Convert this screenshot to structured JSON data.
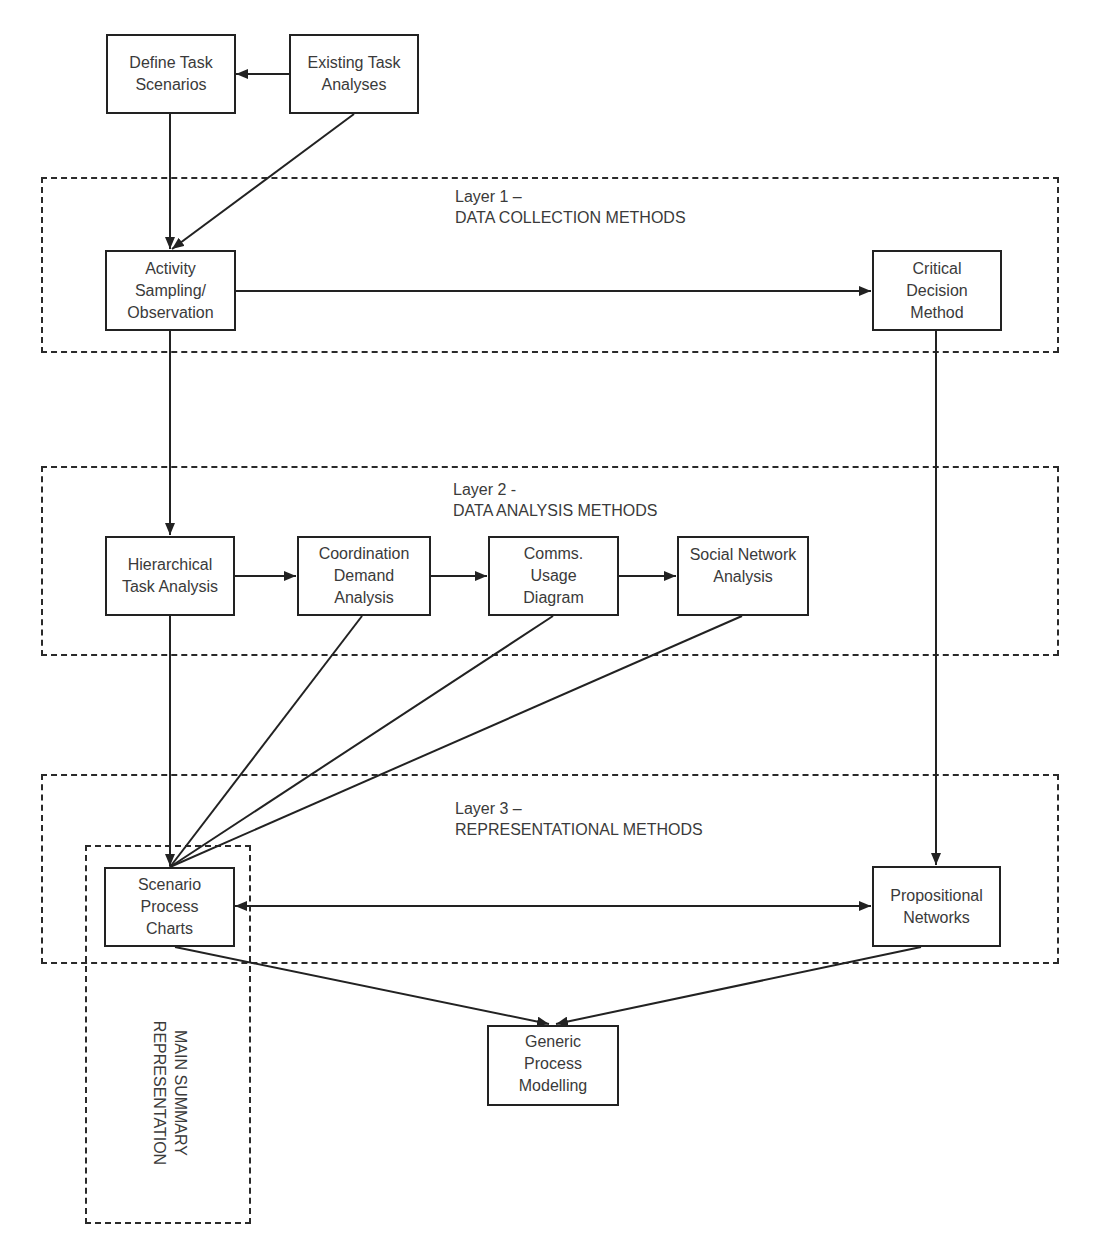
{
  "diagram": {
    "layers": [
      {
        "id": "layer1",
        "label": "Layer 1 –\nDATA COLLECTION METHODS"
      },
      {
        "id": "layer2",
        "label": "Layer 2 -\nDATA ANALYSIS METHODS"
      },
      {
        "id": "layer3",
        "label": "Layer 3 –\nREPRESENTATIONAL METHODS"
      }
    ],
    "summary_label": "MAIN SUMMARY\nREPRESENTATION",
    "nodes": {
      "define_task_scenarios": "Define Task\nScenarios",
      "existing_task_analyses": "Existing Task\nAnalyses",
      "activity_sampling": "Activity\nSampling/\nObservation",
      "critical_decision_method": "Critical\nDecision\nMethod",
      "hierarchical_task_analysis": "Hierarchical\nTask Analysis",
      "coordination_demand_analysis": "Coordination\nDemand\nAnalysis",
      "comms_usage_diagram": "Comms.\nUsage\nDiagram",
      "social_network_analysis": "Social Network\nAnalysis",
      "scenario_process_charts": "Scenario\nProcess\nCharts",
      "propositional_networks": "Propositional\nNetworks",
      "generic_process_modelling": "Generic\nProcess\nModelling"
    },
    "edges": [
      {
        "from": "existing_task_analyses",
        "to": "define_task_scenarios"
      },
      {
        "from": "define_task_scenarios",
        "to": "activity_sampling"
      },
      {
        "from": "existing_task_analyses",
        "to": "activity_sampling"
      },
      {
        "from": "activity_sampling",
        "to": "critical_decision_method"
      },
      {
        "from": "activity_sampling",
        "to": "hierarchical_task_analysis"
      },
      {
        "from": "hierarchical_task_analysis",
        "to": "coordination_demand_analysis"
      },
      {
        "from": "coordination_demand_analysis",
        "to": "comms_usage_diagram"
      },
      {
        "from": "comms_usage_diagram",
        "to": "social_network_analysis"
      },
      {
        "from": "hierarchical_task_analysis",
        "to": "scenario_process_charts"
      },
      {
        "from": "coordination_demand_analysis",
        "to": "scenario_process_charts"
      },
      {
        "from": "comms_usage_diagram",
        "to": "scenario_process_charts"
      },
      {
        "from": "social_network_analysis",
        "to": "scenario_process_charts"
      },
      {
        "from": "critical_decision_method",
        "to": "propositional_networks"
      },
      {
        "from": "scenario_process_charts",
        "to": "propositional_networks",
        "bidirectional": true
      },
      {
        "from": "scenario_process_charts",
        "to": "generic_process_modelling"
      },
      {
        "from": "propositional_networks",
        "to": "generic_process_modelling"
      }
    ],
    "colors": {
      "stroke": "#222222",
      "text": "#3a3a3a",
      "background": "#ffffff"
    }
  }
}
